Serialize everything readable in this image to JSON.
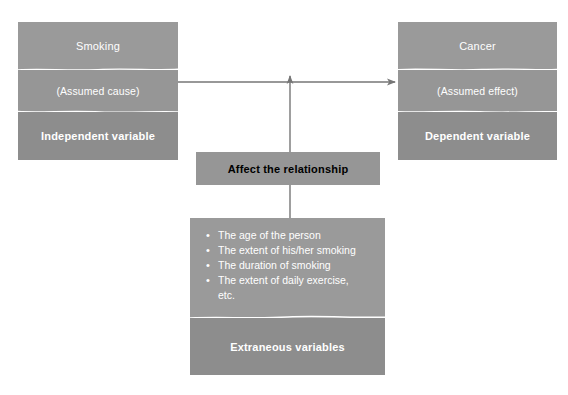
{
  "diagram": {
    "colors": {
      "band_light": "#9a9a9a",
      "band_mid": "#969696",
      "band_dark": "#8d8d8d",
      "divider": "#ffffff",
      "connector": "#767676",
      "text": "#ffffff",
      "background": "#ffffff"
    }
  },
  "independent": {
    "title": "Smoking",
    "subtitle": "(Assumed cause)",
    "role": "Independent variable"
  },
  "dependent": {
    "title": "Cancer",
    "subtitle": "(Assumed effect)",
    "role": "Dependent variable"
  },
  "moderator": {
    "label": "Affect the relationship"
  },
  "extraneous": {
    "items": [
      "The age of the person",
      "The extent of his/her smoking",
      "The duration of smoking",
      "The extent of daily exercise,",
      "etc."
    ],
    "role": "Extraneous variables"
  },
  "connectors": {
    "cause_to_effect": "arrow-right",
    "moderator_to_relationship": "arrow-up",
    "extraneous_to_moderator": "line-vertical"
  },
  "caption": {
    "text": ""
  }
}
